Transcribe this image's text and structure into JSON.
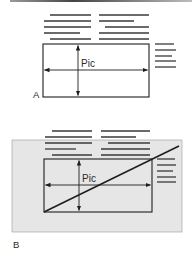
{
  "figure": {
    "colors": {
      "ink": "#1e1e1e",
      "text_line": "#3a3a3a",
      "panel_b_background": "#e6e6e6",
      "top_rule": "#555555"
    }
  },
  "panels": [
    {
      "id": "A",
      "label": "A",
      "picture_label": "Pic",
      "shaded_background": false,
      "diagonal": false,
      "text_lines_left": [
        {
          "y": 15,
          "x1": 50,
          "x2": 91
        },
        {
          "y": 21,
          "x1": 44,
          "x2": 91
        },
        {
          "y": 27,
          "x1": 44,
          "x2": 91
        },
        {
          "y": 33,
          "x1": 44,
          "x2": 80
        },
        {
          "y": 39,
          "x1": 50,
          "x2": 91
        }
      ],
      "text_lines_right": [
        {
          "y": 15,
          "x1": 99,
          "x2": 149
        },
        {
          "y": 21,
          "x1": 99,
          "x2": 134
        },
        {
          "y": 27,
          "x1": 105,
          "x2": 149
        },
        {
          "y": 33,
          "x1": 99,
          "x2": 149
        },
        {
          "y": 39,
          "x1": 99,
          "x2": 149
        }
      ],
      "side_lines": [
        {
          "y": 44,
          "x1": 155,
          "x2": 174
        },
        {
          "y": 50,
          "x1": 155,
          "x2": 176
        },
        {
          "y": 56,
          "x1": 155,
          "x2": 172
        },
        {
          "y": 61,
          "x1": 155,
          "x2": 176
        },
        {
          "y": 67,
          "x1": 155,
          "x2": 176
        }
      ],
      "picture_box": {
        "x": 43,
        "y": 44,
        "w": 106,
        "h": 53
      },
      "vertical_arrow_x": 78,
      "horizontal_arrow_y": 70,
      "picture_label_pos": {
        "x": 81,
        "y": 67
      },
      "panel_label_pos": {
        "x": 33,
        "y": 98
      }
    },
    {
      "id": "B",
      "label": "B",
      "picture_label": "Pic",
      "shaded_background": true,
      "background_box": {
        "x": 12,
        "y": 140,
        "w": 170,
        "h": 92
      },
      "diagonal": true,
      "diagonal_line": {
        "x1": 44,
        "y1": 212,
        "x2": 179,
        "y2": 146
      },
      "text_lines_left": [
        {
          "y": 131,
          "x1": 52,
          "x2": 92
        },
        {
          "y": 137,
          "x1": 45,
          "x2": 92
        },
        {
          "y": 143,
          "x1": 45,
          "x2": 92
        },
        {
          "y": 149,
          "x1": 45,
          "x2": 76
        },
        {
          "y": 155,
          "x1": 52,
          "x2": 92
        }
      ],
      "text_lines_right": [
        {
          "y": 131,
          "x1": 101,
          "x2": 150
        },
        {
          "y": 137,
          "x1": 101,
          "x2": 136
        },
        {
          "y": 143,
          "x1": 108,
          "x2": 150
        },
        {
          "y": 149,
          "x1": 101,
          "x2": 150
        },
        {
          "y": 155,
          "x1": 101,
          "x2": 150
        }
      ],
      "side_lines": [
        {
          "y": 159,
          "x1": 157,
          "x2": 175
        },
        {
          "y": 165,
          "x1": 157,
          "x2": 176
        },
        {
          "y": 171,
          "x1": 157,
          "x2": 173
        },
        {
          "y": 177,
          "x1": 157,
          "x2": 176
        },
        {
          "y": 182,
          "x1": 157,
          "x2": 176
        }
      ],
      "picture_box": {
        "x": 44,
        "y": 159,
        "w": 108,
        "h": 53
      },
      "vertical_arrow_x": 79,
      "horizontal_arrow_y": 185,
      "picture_label_pos": {
        "x": 82,
        "y": 182
      },
      "panel_label_pos": {
        "x": 13,
        "y": 248
      }
    }
  ]
}
